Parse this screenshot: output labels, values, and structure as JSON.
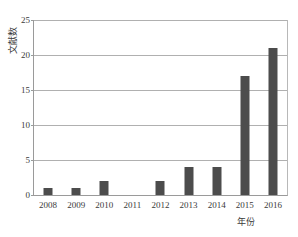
{
  "chart_data": {
    "type": "bar",
    "title": "",
    "xlabel": "年份",
    "ylabel": "文献数",
    "categories": [
      "2008",
      "2009",
      "2010",
      "2011",
      "2012",
      "2013",
      "2014",
      "2015",
      "2016"
    ],
    "values": [
      1,
      1,
      2,
      0,
      2,
      4,
      4,
      17,
      21
    ],
    "series": [
      {
        "name": "文献数",
        "values": [
          1,
          1,
          2,
          0,
          2,
          4,
          4,
          17,
          21
        ]
      }
    ],
    "ylim": [
      0,
      25
    ],
    "yticks": [
      0,
      5,
      10,
      15,
      20,
      25
    ],
    "ytick_labels": [
      "0",
      "5",
      "10",
      "15",
      "20",
      "25"
    ],
    "grid": true,
    "legend": false,
    "bar_color": "#4c4c4c",
    "grid_color": "#b0b0b0",
    "axis_color": "#9a9a9a",
    "text_color": "#3a3a3a"
  }
}
